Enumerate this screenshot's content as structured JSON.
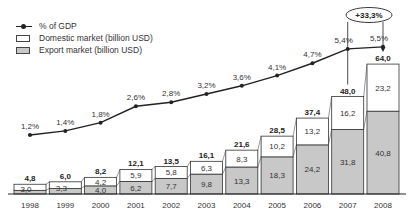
{
  "legend": {
    "gdp": "% of GDP",
    "domestic": "Domestic market (billion USD)",
    "export": "Export market (billion USD)"
  },
  "colors": {
    "domestic": "#ffffff",
    "export": "#c8c8c8",
    "line": "#222222",
    "border": "#333333"
  },
  "annotation": {
    "growth": "+33,3%"
  },
  "chart_data": {
    "type": "bar",
    "stacked": true,
    "title": "",
    "xlabel": "",
    "ylabel": "",
    "categories": [
      "1998",
      "1999",
      "2000",
      "2001",
      "2002",
      "2003",
      "2004",
      "2005",
      "2006",
      "2007",
      "2008"
    ],
    "series": [
      {
        "name": "Export market (billion USD)",
        "values": [
          1.8,
          2.7,
          4.0,
          6.2,
          7.7,
          9.8,
          13.3,
          18.3,
          24.2,
          31.8,
          40.8
        ]
      },
      {
        "name": "Domestic market (billion USD)",
        "values": [
          3.0,
          3.3,
          4.2,
          5.9,
          5.8,
          6.3,
          8.3,
          10.2,
          13.2,
          16.2,
          23.2
        ]
      },
      {
        "name": "% of GDP",
        "type": "line",
        "values": [
          1.2,
          1.4,
          1.8,
          2.6,
          2.8,
          3.2,
          3.6,
          4.1,
          4.7,
          5.4,
          5.5
        ]
      }
    ],
    "totals": [
      4.8,
      6.0,
      8.2,
      12.1,
      13.5,
      16.1,
      21.6,
      28.5,
      37.4,
      48.0,
      64.0
    ],
    "labels": {
      "export": [
        "1,8",
        "2,7",
        "4,0",
        "6,2",
        "7,7",
        "9,8",
        "13,3",
        "18,3",
        "24,2",
        "31,8",
        "40,8"
      ],
      "domestic": [
        "3,0",
        "3,3",
        "4,2",
        "5,9",
        "5,8",
        "6,3",
        "8,3",
        "10,2",
        "13,2",
        "16,2",
        "23,2"
      ],
      "totals": [
        "4,8",
        "6,0",
        "8,2",
        "12,1",
        "13,5",
        "16,1",
        "21,6",
        "28,5",
        "37,4",
        "48,0",
        "64,0"
      ],
      "gdp": [
        "1,2%",
        "1,4%",
        "1,8%",
        "2,6%",
        "2,8%",
        "3,2%",
        "3,6%",
        "4,1%",
        "4,7%",
        "5,4%",
        "5,5%"
      ]
    },
    "annotations": [
      "+33,3% growth 2007→2008"
    ],
    "legend_position": "top-left",
    "grid": false
  }
}
